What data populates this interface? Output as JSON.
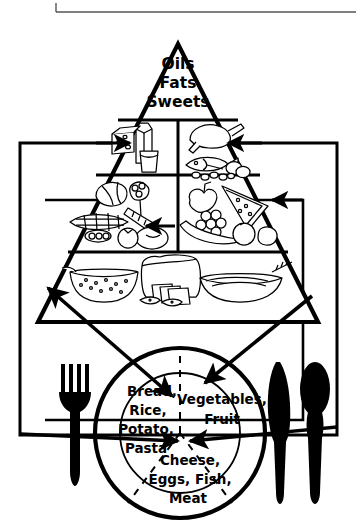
{
  "figure": {
    "style": "black-and-white line drawing",
    "ink_color": "#000000",
    "paper_color": "#ffffff"
  },
  "pyramid": {
    "apex_label_lines": [
      "Oils",
      "Fats",
      "Sweets"
    ],
    "tiers": [
      {
        "name": "apex-tier",
        "label": "Oils Fats Sweets",
        "panels": [
          {
            "name": "oils-fats-sweets-panel",
            "contents": "Oils, Fats, Sweets"
          }
        ]
      },
      {
        "name": "dairy-protein-tier",
        "label": "",
        "panels": [
          {
            "name": "dairy-panel",
            "contents": "cheese wedge, milk glass, milk carton"
          },
          {
            "name": "meat-protein-panel",
            "contents": "roast poultry, fish, eggs, beans, nuts"
          }
        ]
      },
      {
        "name": "produce-tier",
        "label": "",
        "panels": [
          {
            "name": "vegetables-panel",
            "contents": "lettuce, broccoli, corn, carrot, potato, peas"
          },
          {
            "name": "fruit-panel",
            "contents": "watermelon, grapes, banana, apple, pear, orange, lemon"
          }
        ]
      },
      {
        "name": "grains-tier",
        "label": "",
        "panels": [
          {
            "name": "grains-panel",
            "contents": "bowl of cereal, loaf of bread, sliced bread, crackers, pasta bowl, wheat stalks"
          }
        ]
      }
    ]
  },
  "plate": {
    "name": "dinner-plate",
    "sections": [
      {
        "name": "plate-section-grains",
        "position": "left",
        "lines": [
          "Bread,",
          "Rice,",
          "Potato,",
          "Pasta"
        ]
      },
      {
        "name": "plate-section-produce",
        "position": "right",
        "lines": [
          "Vegetables,",
          "Fruit"
        ]
      },
      {
        "name": "plate-section-protein",
        "position": "bottom",
        "lines": [
          "Cheese,",
          "Eggs, Fish,",
          "Meat"
        ]
      }
    ]
  },
  "place_setting": {
    "items": [
      {
        "name": "fork",
        "position": "left-of-plate"
      },
      {
        "name": "knife",
        "position": "right-of-plate"
      },
      {
        "name": "spoon",
        "position": "far-right-of-plate"
      },
      {
        "name": "placemat",
        "position": "under-setting"
      }
    ]
  },
  "connectors": [
    {
      "name": "arrow-grains-to-plate",
      "from": "grains-panel",
      "to": "plate-section-grains",
      "style": "double-headed diagonal"
    },
    {
      "name": "arrow-produce-to-plate",
      "from": "fruit-panel",
      "to": "plate-section-produce",
      "style": "double-headed diagonal"
    },
    {
      "name": "arrow-dairy-inward-left",
      "from": "placemat-left",
      "to": "dairy-panel",
      "style": "single-headed horizontal"
    },
    {
      "name": "arrow-protein-inward-right",
      "from": "placemat-right",
      "to": "meat-protein-panel",
      "style": "single-headed horizontal"
    },
    {
      "name": "arrow-vegetables-inward",
      "from": "inner-box-left",
      "to": "vegetables-panel",
      "style": "single-headed horizontal"
    },
    {
      "name": "arrow-fruit-inward",
      "from": "inner-box-right",
      "to": "fruit-panel",
      "style": "single-headed horizontal"
    },
    {
      "name": "arrow-plate-center-left",
      "to": "plate-center",
      "style": "single-headed horizontal"
    },
    {
      "name": "arrow-plate-center-right",
      "to": "plate-center",
      "style": "single-headed horizontal"
    }
  ]
}
